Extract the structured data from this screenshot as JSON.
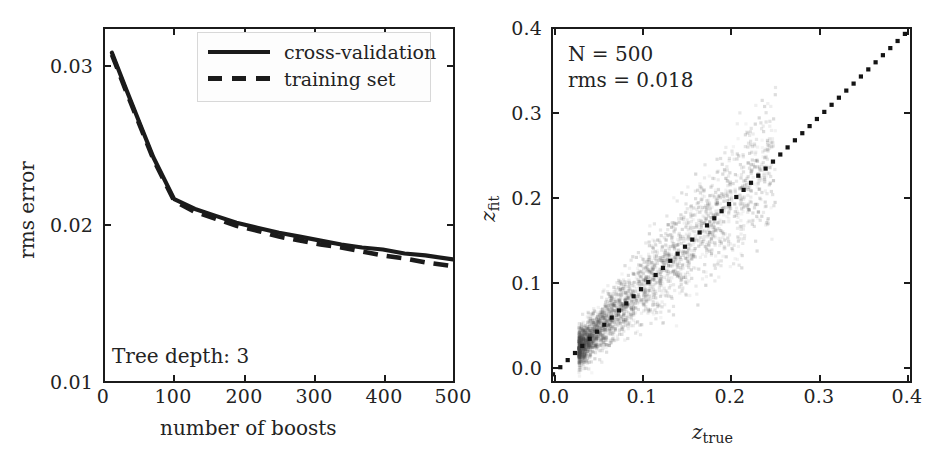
{
  "figure": {
    "width": 947,
    "height": 461,
    "background": "#ffffff",
    "ink_color": "#1b1b1b"
  },
  "left_panel": {
    "xlabel": "number of boosts",
    "ylabel": "rms error",
    "annotation": "Tree depth: 3",
    "xticklabels": [
      "0",
      "100",
      "200",
      "300",
      "400",
      "500"
    ],
    "yticklabels": [
      "0.01",
      "0.02",
      "0.03"
    ],
    "legend": {
      "items": [
        {
          "label": "cross-validation",
          "style": "solid"
        },
        {
          "label": "training set",
          "style": "dashed"
        }
      ]
    }
  },
  "right_panel": {
    "xlabel_base": "z",
    "xlabel_sub": "true",
    "ylabel_base": "z",
    "ylabel_sub": "fit",
    "annotation_line1": "N = 500",
    "annotation_line2": "rms = 0.018",
    "xticklabels": [
      "0.0",
      "0.1",
      "0.2",
      "0.3",
      "0.4"
    ],
    "yticklabels": [
      "0.0",
      "0.1",
      "0.2",
      "0.3",
      "0.4"
    ]
  },
  "chart_data": [
    {
      "type": "line",
      "id": "boosting-error-curve",
      "title": "",
      "xlabel": "number of boosts",
      "ylabel": "rms error",
      "xlim": [
        0,
        500
      ],
      "ylim": [
        0.01,
        0.0315
      ],
      "xticks": [
        0,
        100,
        200,
        300,
        400,
        500
      ],
      "yticks": [
        0.01,
        0.02,
        0.03
      ],
      "grid": false,
      "legend_position": "upper right",
      "annotations": [
        {
          "text": "Tree depth: 3",
          "x": 18,
          "y": 0.0108
        }
      ],
      "x": [
        10,
        30,
        50,
        70,
        100,
        130,
        160,
        190,
        220,
        250,
        280,
        310,
        340,
        370,
        400,
        430,
        460,
        500
      ],
      "series": [
        {
          "name": "cross-validation",
          "style": "solid",
          "values": [
            0.03,
            0.0279,
            0.0259,
            0.0239,
            0.0215,
            0.0209,
            0.0205,
            0.0201,
            0.0198,
            0.0195,
            0.0193,
            0.0191,
            0.0189,
            0.0187,
            0.0186,
            0.0184,
            0.0183,
            0.0181
          ]
        },
        {
          "name": "training set",
          "style": "dashed",
          "values": [
            0.0299,
            0.0278,
            0.0258,
            0.0238,
            0.0214,
            0.0208,
            0.0204,
            0.02,
            0.0197,
            0.0194,
            0.0192,
            0.019,
            0.0188,
            0.0186,
            0.0184,
            0.0182,
            0.018,
            0.0178
          ]
        }
      ]
    },
    {
      "type": "scatter",
      "id": "photoz-true-vs-fit",
      "title": "",
      "xlabel": "z_true",
      "ylabel": "z_fit",
      "xlim": [
        -0.012,
        0.4
      ],
      "ylim": [
        -0.02,
        0.4
      ],
      "xticks": [
        0.0,
        0.1,
        0.2,
        0.3,
        0.4
      ],
      "yticks": [
        0.0,
        0.1,
        0.2,
        0.3,
        0.4
      ],
      "grid": false,
      "n_points": 500,
      "rms": 0.018,
      "annotations": [
        {
          "text": "N = 500",
          "x": 0.022,
          "y": 0.368
        },
        {
          "text": "rms = 0.018",
          "x": 0.022,
          "y": 0.338
        }
      ],
      "reference_line": {
        "name": "one-to-one",
        "style": "dotted",
        "x": [
          -0.012,
          0.4
        ],
        "y": [
          -0.012,
          0.4
        ]
      },
      "point_color": "#606060",
      "cloud_center_x": 0.095,
      "cloud_center_y": 0.098,
      "cloud_x_range": [
        0.018,
        0.245
      ],
      "cloud_y_range": [
        0.03,
        0.245
      ],
      "scatter_sigma": 0.018
    }
  ]
}
